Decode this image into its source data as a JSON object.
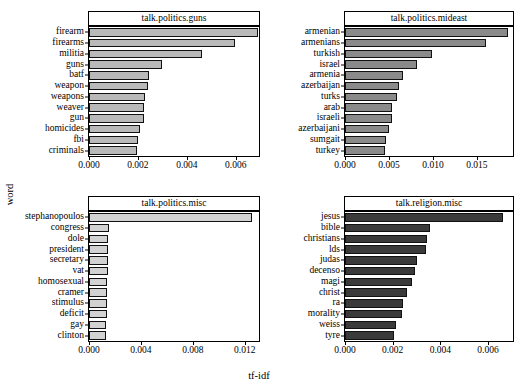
{
  "figure": {
    "ylabel": "word",
    "xlabel": "tf-idf",
    "panel_count": 4
  },
  "chart_data": [
    {
      "type": "bar",
      "orientation": "horizontal",
      "title": "talk.politics.guns",
      "xlabel": "tf-idf",
      "ylabel": "word",
      "xlim": [
        0.0,
        0.00695
      ],
      "xticks": [
        0.0,
        0.002,
        0.004,
        0.006
      ],
      "xticklabels": [
        "0.000",
        "0.002",
        "0.004",
        "0.006"
      ],
      "grid": false,
      "bar_color": "#b9b9b9",
      "categories": [
        "firearm",
        "firearms",
        "militia",
        "guns",
        "batf",
        "weapon",
        "weapons",
        "weaver",
        "gun",
        "homicides",
        "fbi",
        "criminals"
      ],
      "values": [
        0.0069,
        0.00595,
        0.0046,
        0.00298,
        0.00245,
        0.0024,
        0.00228,
        0.00226,
        0.00224,
        0.00209,
        0.00199,
        0.00197
      ]
    },
    {
      "type": "bar",
      "orientation": "horizontal",
      "title": "talk.politics.mideast",
      "xlabel": "tf-idf",
      "ylabel": "word",
      "xlim": [
        0.0,
        0.0191
      ],
      "xticks": [
        0.0,
        0.005,
        0.01,
        0.015
      ],
      "xticklabels": [
        "0.000",
        "0.005",
        "0.010",
        "0.015"
      ],
      "grid": false,
      "bar_color": "#8a8a8a",
      "categories": [
        "armenian",
        "armenians",
        "turkish",
        "israel",
        "armenia",
        "azerbaijan",
        "turks",
        "arab",
        "israeli",
        "azerbaijani",
        "sumgait",
        "turkey"
      ],
      "values": [
        0.01855,
        0.01605,
        0.00985,
        0.00815,
        0.00665,
        0.0061,
        0.0059,
        0.00535,
        0.0053,
        0.00505,
        0.0047,
        0.00455
      ]
    },
    {
      "type": "bar",
      "orientation": "horizontal",
      "title": "talk.politics.misc",
      "xlabel": "tf-idf",
      "ylabel": "word",
      "xlim": [
        0.0,
        0.0131
      ],
      "xticks": [
        0.0,
        0.004,
        0.008,
        0.012
      ],
      "xticklabels": [
        "0.000",
        "0.004",
        "0.008",
        "0.012"
      ],
      "grid": false,
      "bar_color": "#d2d2d2",
      "categories": [
        "stephanopoulos",
        "congress",
        "dole",
        "president",
        "secretary",
        "vat",
        "homosexual",
        "cramer",
        "stimulus",
        "deficit",
        "gay",
        "clinton"
      ],
      "values": [
        0.01258,
        0.00155,
        0.0015,
        0.00148,
        0.00148,
        0.00147,
        0.00142,
        0.0014,
        0.00138,
        0.00135,
        0.00133,
        0.00131
      ]
    },
    {
      "type": "bar",
      "orientation": "horizontal",
      "title": "talk.religion.misc",
      "xlabel": "tf-idf",
      "ylabel": "word",
      "xlim": [
        0.0,
        0.00705
      ],
      "xticks": [
        0.0,
        0.002,
        0.004,
        0.006
      ],
      "xticklabels": [
        "0.000",
        "0.002",
        "0.004",
        "0.006"
      ],
      "grid": false,
      "bar_color": "#3a3a3a",
      "categories": [
        "jesus",
        "bible",
        "christians",
        "lds",
        "judas",
        "decenso",
        "magi",
        "christ",
        "ra",
        "morality",
        "weiss",
        "tyre"
      ],
      "values": [
        0.00665,
        0.00358,
        0.00345,
        0.00338,
        0.00303,
        0.00293,
        0.0028,
        0.00262,
        0.00243,
        0.0024,
        0.00212,
        0.00207
      ]
    }
  ]
}
